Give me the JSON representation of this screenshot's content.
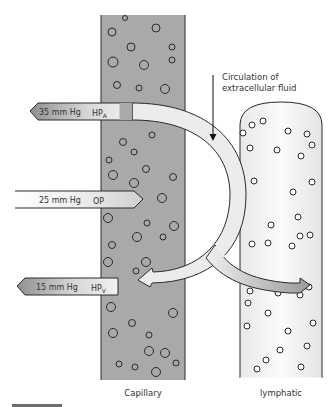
{
  "labels": {
    "capillary": "Capillary",
    "lymphatic": "lymphatic",
    "circulation_line1": "Circulation of",
    "circulation_line2": "extracellular fluid"
  },
  "pressures": [
    {
      "id": "hpa",
      "value": "35 mm Hg",
      "symbol": "HP",
      "subscript": "A",
      "direction": "out"
    },
    {
      "id": "op",
      "value": "25 mm Hg",
      "symbol": "OP",
      "subscript": "",
      "direction": "in"
    },
    {
      "id": "hpv",
      "value": "15 mm Hg",
      "symbol": "HP",
      "subscript": "V",
      "direction": "out"
    }
  ],
  "colors": {
    "capillary_fill": "#a9a9a9",
    "lymphatic_fill": "#f2f2f2",
    "arrow_light": "#ececec",
    "arrow_dark": "#8a8a8a",
    "outline": "#2a2a2a",
    "text": "#333333"
  },
  "capillary_particles": [
    [
      125,
      18,
      2.5
    ],
    [
      112,
      32,
      4
    ],
    [
      156,
      28,
      4
    ],
    [
      131,
      47,
      4
    ],
    [
      172,
      47,
      3
    ],
    [
      113,
      62,
      5
    ],
    [
      144,
      65,
      4.5
    ],
    [
      172,
      60,
      3
    ],
    [
      117,
      85,
      3.5
    ],
    [
      139,
      88,
      3
    ],
    [
      165,
      89,
      4.5
    ],
    [
      152,
      135,
      3
    ],
    [
      123,
      142,
      3.5
    ],
    [
      134,
      152,
      3
    ],
    [
      109,
      160,
      3
    ],
    [
      113,
      175,
      4.5
    ],
    [
      146,
      169,
      3.5
    ],
    [
      134,
      183,
      4.5
    ],
    [
      173,
      177,
      3.5
    ],
    [
      162,
      198,
      4.5
    ],
    [
      108,
      218,
      4.5
    ],
    [
      147,
      223,
      3
    ],
    [
      174,
      226,
      4.5
    ],
    [
      137,
      237,
      4.5
    ],
    [
      163,
      237,
      3
    ],
    [
      112,
      245,
      3.5
    ],
    [
      108,
      262,
      4.5
    ],
    [
      146,
      262,
      4.5
    ],
    [
      136,
      271,
      3
    ],
    [
      111,
      307,
      4.5
    ],
    [
      173,
      313,
      4.5
    ],
    [
      132,
      323,
      3.5
    ],
    [
      113,
      333,
      4.5
    ],
    [
      149,
      335,
      3
    ],
    [
      149,
      351,
      4.5
    ],
    [
      165,
      353,
      4.5
    ],
    [
      119,
      364,
      3
    ],
    [
      135,
      367,
      3
    ],
    [
      156,
      372,
      4.5
    ],
    [
      176,
      363,
      3
    ]
  ],
  "lymphatic_particles": [
    [
      252,
      125,
      3
    ],
    [
      263,
      121,
      3
    ],
    [
      243,
      133,
      3
    ],
    [
      288,
      131,
      3
    ],
    [
      307,
      134,
      3
    ],
    [
      312,
      145,
      3
    ],
    [
      250,
      148,
      3
    ],
    [
      277,
      150,
      3
    ],
    [
      301,
      156,
      3
    ],
    [
      312,
      182,
      3
    ],
    [
      254,
      181,
      3
    ],
    [
      293,
      192,
      3
    ],
    [
      298,
      217,
      3
    ],
    [
      271,
      225,
      3
    ],
    [
      300,
      236,
      3
    ],
    [
      252,
      244,
      3
    ],
    [
      268,
      243,
      3
    ],
    [
      292,
      246,
      3
    ],
    [
      310,
      235,
      3
    ],
    [
      250,
      291,
      3
    ],
    [
      278,
      293,
      3
    ],
    [
      300,
      295,
      3
    ],
    [
      309,
      287,
      3
    ],
    [
      248,
      303,
      3
    ],
    [
      268,
      313,
      3
    ],
    [
      247,
      326,
      3
    ],
    [
      313,
      323,
      3
    ],
    [
      288,
      331,
      3
    ],
    [
      307,
      346,
      3
    ],
    [
      280,
      350,
      3
    ],
    [
      266,
      360,
      3
    ],
    [
      257,
      369,
      3
    ],
    [
      301,
      367,
      3
    ]
  ]
}
